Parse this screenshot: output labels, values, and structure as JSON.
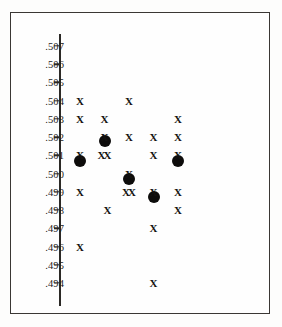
{
  "figure": {
    "background_color": "#fdfdfc",
    "frame_color": "#3a3734",
    "axis_color": "#2b2926",
    "marker_color": "#141210",
    "mean_marker_color": "#0d0c0b"
  },
  "axis": {
    "tick_labels": [
      ".507",
      ".506",
      ".505",
      ".504",
      ".503",
      ".502",
      ".501",
      ".500",
      ".499",
      ".498",
      ".497",
      ".496",
      ".495",
      ".494"
    ],
    "tick_values": [
      0.507,
      0.506,
      0.505,
      0.504,
      0.503,
      0.502,
      0.501,
      0.5,
      0.499,
      0.498,
      0.497,
      0.496,
      0.495,
      0.494
    ]
  },
  "chart_data": {
    "type": "scatter",
    "title": "",
    "xlabel": "",
    "ylabel": "",
    "ylim": [
      0.4935,
      0.5075
    ],
    "xlim": [
      0.4,
      5.6
    ],
    "grid": false,
    "legend": null,
    "y_tick_labels": [
      ".507",
      ".506",
      ".505",
      ".504",
      ".503",
      ".502",
      ".501",
      ".500",
      ".499",
      ".498",
      ".497",
      ".496",
      ".495",
      ".494"
    ],
    "y_ticks": [
      0.507,
      0.506,
      0.505,
      0.504,
      0.503,
      0.502,
      0.501,
      0.5,
      0.499,
      0.498,
      0.497,
      0.496,
      0.495,
      0.494
    ],
    "x_tick_labels": [],
    "series": [
      {
        "name": "individual-measurements",
        "marker": "x",
        "points": [
          {
            "group": 1,
            "x": 1.0,
            "y": 0.504
          },
          {
            "group": 1,
            "x": 1.0,
            "y": 0.503
          },
          {
            "group": 1,
            "x": 1.0,
            "y": 0.501
          },
          {
            "group": 1,
            "x": 1.0,
            "y": 0.499
          },
          {
            "group": 1,
            "x": 1.0,
            "y": 0.496
          },
          {
            "group": 2,
            "x": 2.0,
            "y": 0.503
          },
          {
            "group": 2,
            "x": 2.0,
            "y": 0.502
          },
          {
            "group": 2,
            "x": 1.88,
            "y": 0.501
          },
          {
            "group": 2,
            "x": 2.12,
            "y": 0.501
          },
          {
            "group": 2,
            "x": 2.12,
            "y": 0.498
          },
          {
            "group": 3,
            "x": 3.0,
            "y": 0.504
          },
          {
            "group": 3,
            "x": 3.0,
            "y": 0.502
          },
          {
            "group": 3,
            "x": 3.0,
            "y": 0.5
          },
          {
            "group": 3,
            "x": 2.88,
            "y": 0.499
          },
          {
            "group": 3,
            "x": 3.12,
            "y": 0.499
          },
          {
            "group": 4,
            "x": 4.0,
            "y": 0.502
          },
          {
            "group": 4,
            "x": 4.0,
            "y": 0.501
          },
          {
            "group": 4,
            "x": 4.0,
            "y": 0.499
          },
          {
            "group": 4,
            "x": 4.0,
            "y": 0.497
          },
          {
            "group": 4,
            "x": 4.0,
            "y": 0.494
          },
          {
            "group": 5,
            "x": 5.0,
            "y": 0.503
          },
          {
            "group": 5,
            "x": 5.0,
            "y": 0.502
          },
          {
            "group": 5,
            "x": 5.0,
            "y": 0.501
          },
          {
            "group": 5,
            "x": 5.0,
            "y": 0.499
          },
          {
            "group": 5,
            "x": 5.0,
            "y": 0.498
          }
        ]
      },
      {
        "name": "group-means",
        "marker": "filled-circle",
        "points": [
          {
            "group": 1,
            "x": 1.0,
            "y": 0.5007
          },
          {
            "group": 2,
            "x": 2.0,
            "y": 0.5018
          },
          {
            "group": 3,
            "x": 3.0,
            "y": 0.4997
          },
          {
            "group": 4,
            "x": 4.0,
            "y": 0.4987
          },
          {
            "group": 5,
            "x": 5.0,
            "y": 0.5007
          }
        ]
      }
    ]
  }
}
